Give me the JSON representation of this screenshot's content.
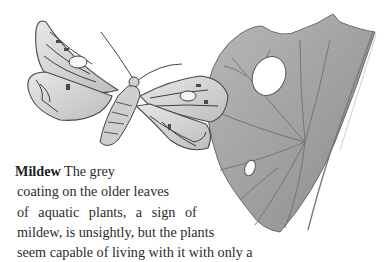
{
  "illustration": {
    "subjects": [
      "moth",
      "leaf"
    ],
    "palette": {
      "ink": "#3a3a3a",
      "leaf_fill": "#9a9a9a",
      "leaf_light": "#c4c4c4",
      "background": "#ffffff"
    }
  },
  "caption": {
    "heading": "Mildew",
    "lines": [
      "The grey",
      "coating on the older leaves",
      "of aquatic plants, a sign of",
      "mildew, is unsightly, but the plants",
      "seem capable of living with it with only a"
    ]
  }
}
